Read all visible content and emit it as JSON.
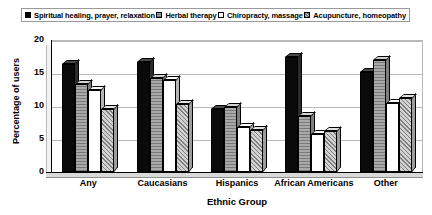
{
  "chart_data": {
    "type": "bar",
    "title": "",
    "xlabel": "Ethnic Group",
    "ylabel": "Percentage of users",
    "ylim": [
      0,
      20
    ],
    "yticks": [
      0,
      5,
      10,
      15,
      20
    ],
    "grid": true,
    "legend_position": "top",
    "style": "3d-grouped-bar",
    "categories": [
      "Any",
      "Caucasians",
      "Hispanics",
      "African Americans",
      "Other"
    ],
    "series": [
      {
        "name": "Spiritual healing, prayer, relaxation",
        "fill": "solid-black",
        "color": "#0a0a0a",
        "values": [
          16.3,
          16.7,
          9.5,
          17.5,
          15.2
        ]
      },
      {
        "name": "Herbal therapy",
        "fill": "gray",
        "color": "#a9a9a9",
        "values": [
          13.3,
          14.2,
          9.8,
          8.5,
          17.0
        ]
      },
      {
        "name": "Chiropracty, massage",
        "fill": "white",
        "color": "#ffffff",
        "values": [
          12.5,
          14.0,
          6.8,
          5.8,
          10.5
        ]
      },
      {
        "name": "Acupuncture, homeopathy",
        "fill": "diagonal-hatch",
        "color": "#d2d2d2",
        "values": [
          9.5,
          10.3,
          6.4,
          6.2,
          11.2
        ]
      }
    ]
  },
  "legend": {
    "items": [
      {
        "label": "Spiritual healing, prayer, relaxation",
        "swatch": "solid-black-swatch"
      },
      {
        "label": "Herbal therapy",
        "swatch": "gray-swatch"
      },
      {
        "label": "Chiropracty, massage",
        "swatch": "white-swatch"
      },
      {
        "label": "Acupuncture, homeopathy",
        "swatch": "hatch-swatch"
      }
    ]
  },
  "axes": {
    "y_title": "Percentage of users",
    "x_title": "Ethnic Group",
    "y_tick_labels": [
      "20",
      "15",
      "10",
      "5",
      "0"
    ],
    "x_tick_labels": [
      "Any",
      "Caucasians",
      "Hispanics",
      "African Americans",
      "Other"
    ]
  },
  "colors": {
    "series_1": "#0a0a0a",
    "series_2": "#a9a9a9",
    "series_3": "#ffffff",
    "series_4": "#d2d2d2",
    "gridline": "#b9b9b9",
    "axis": "#000000",
    "background": "#ffffff"
  }
}
